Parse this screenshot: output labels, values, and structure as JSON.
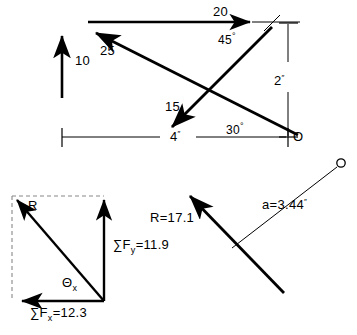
{
  "figure": {
    "stroke_color": "#000000",
    "dashed_color": "#777777",
    "background": "#ffffff"
  },
  "top_diagram": {
    "name": "force-system-diagram",
    "forces": [
      {
        "id": "force-10",
        "label": "10",
        "direction": "up"
      },
      {
        "id": "force-20",
        "label": "20",
        "direction": "right"
      },
      {
        "id": "force-25",
        "label": "25",
        "direction": "up-left"
      },
      {
        "id": "force-15",
        "label": "15",
        "direction": "down-left"
      }
    ],
    "angles": [
      {
        "id": "angle-45",
        "label": "45",
        "degree_symbol": "°"
      },
      {
        "id": "angle-30",
        "label": "30",
        "degree_symbol": "°"
      }
    ],
    "dimensions": [
      {
        "id": "dim-vertical",
        "value": "2",
        "unit": "″"
      },
      {
        "id": "dim-horizontal",
        "value": "4",
        "unit": "″"
      }
    ],
    "points": [
      {
        "id": "point-O",
        "label": "O"
      }
    ]
  },
  "resultant_triangle": {
    "name": "resultant-components-diagram",
    "resultant_label": "R",
    "angle_label": "Θ",
    "angle_subscript": "x",
    "sum_fy": {
      "symbol": "∑F",
      "subscript": "y",
      "equals": "=",
      "value": "11.9"
    },
    "sum_fx": {
      "symbol": "∑F",
      "subscript": "x",
      "equals": "=",
      "value": "12.3"
    }
  },
  "line_of_action": {
    "name": "resultant-line-of-action-diagram",
    "resultant": {
      "symbol": "R",
      "equals": "=",
      "value": "17.1"
    },
    "moment_arm": {
      "symbol": "a",
      "equals": "=",
      "value": "3.44",
      "unit": "″"
    },
    "point": {
      "id": "point-O-right",
      "label": "O"
    }
  }
}
